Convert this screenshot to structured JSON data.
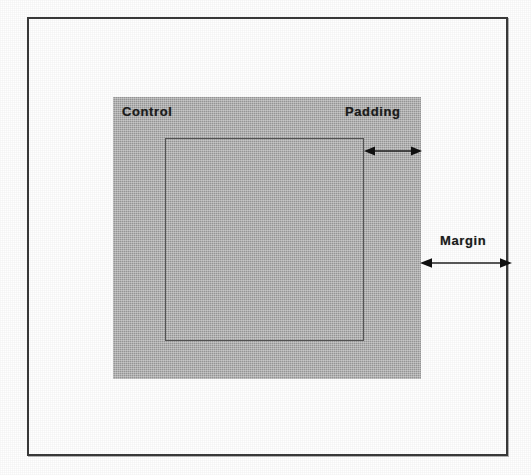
{
  "figure": {
    "kind": "box-model-diagram",
    "background_color": "#ffffff",
    "frame": {
      "name": "outer-frame",
      "border_color": "#3a3a3a",
      "fill": "#ffffff"
    },
    "control": {
      "label": "Control",
      "fill_color": "#b3b3b3",
      "border_color": "#9d9d9d"
    },
    "inner_area": {
      "label": "",
      "border_color": "#555555",
      "fill": "transparent"
    },
    "annotations": [
      {
        "id": "padding",
        "label": "Padding",
        "arrow": "double-headed",
        "orientation": "horizontal",
        "measures": "gap between inner content box edge and control edge"
      },
      {
        "id": "margin",
        "label": "Margin",
        "arrow": "double-headed",
        "orientation": "horizontal",
        "measures": "gap between control edge and outer container edge"
      }
    ]
  },
  "labels": {
    "control": "Control",
    "padding": "Padding",
    "margin": "Margin"
  },
  "colors": {
    "control_fill": "#b3b3b3",
    "frame_border": "#3a3a3a",
    "inner_border": "#555555",
    "text": "#1c1c1c",
    "page": "#ffffff"
  }
}
